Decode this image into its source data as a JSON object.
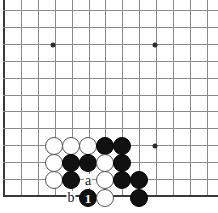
{
  "board": {
    "title": "Go board diagram",
    "geometry": {
      "width": 218,
      "height": 213,
      "origin_x": 4,
      "origin_y": 10,
      "spacing": 16.9,
      "cols": 13,
      "rows": 12,
      "stone_size": 18
    },
    "colors": {
      "background": "#ffffff",
      "grid": "#8a8a8a",
      "edge": "#3a3a3a",
      "black_stone": "#111111",
      "white_stone": "#ffffff",
      "star_point": "#2b2b2b",
      "label_text": "#141414"
    },
    "edges": {
      "left": true,
      "bottom": true,
      "top": false,
      "right": false
    },
    "star_points": [
      {
        "name": "star-point-upper-left",
        "x": 53,
        "y": 45
      },
      {
        "name": "star-point-upper-right",
        "x": 155,
        "y": 45
      },
      {
        "name": "star-point-lower-right",
        "x": 155,
        "y": 146
      }
    ],
    "stones": [
      {
        "name": "white-stone-1",
        "color": "white",
        "x": 54,
        "y": 146,
        "label": ""
      },
      {
        "name": "white-stone-2",
        "color": "white",
        "x": 71,
        "y": 146,
        "label": ""
      },
      {
        "name": "white-stone-3",
        "color": "white",
        "x": 88,
        "y": 146,
        "label": ""
      },
      {
        "name": "black-stone-1",
        "color": "black",
        "x": 105,
        "y": 146,
        "label": ""
      },
      {
        "name": "black-stone-2",
        "color": "black",
        "x": 122,
        "y": 146,
        "label": ""
      },
      {
        "name": "white-stone-4",
        "color": "white",
        "x": 54,
        "y": 163,
        "label": ""
      },
      {
        "name": "black-stone-3",
        "color": "black",
        "x": 71,
        "y": 163,
        "label": ""
      },
      {
        "name": "black-stone-4",
        "color": "black",
        "x": 88,
        "y": 163,
        "label": ""
      },
      {
        "name": "white-stone-5",
        "color": "white",
        "x": 105,
        "y": 163,
        "label": ""
      },
      {
        "name": "black-stone-5",
        "color": "black",
        "x": 122,
        "y": 163,
        "label": ""
      },
      {
        "name": "white-stone-6",
        "color": "white",
        "x": 54,
        "y": 180,
        "label": ""
      },
      {
        "name": "black-stone-6",
        "color": "black",
        "x": 71,
        "y": 180,
        "label": ""
      },
      {
        "name": "white-stone-7",
        "color": "white",
        "x": 105,
        "y": 180,
        "label": ""
      },
      {
        "name": "black-stone-7",
        "color": "black",
        "x": 122,
        "y": 180,
        "label": ""
      },
      {
        "name": "black-stone-8",
        "color": "black",
        "x": 139,
        "y": 180,
        "label": ""
      },
      {
        "name": "black-stone-move-1",
        "color": "black",
        "x": 88,
        "y": 198,
        "label": "1"
      },
      {
        "name": "white-stone-8",
        "color": "white",
        "x": 105,
        "y": 198,
        "label": ""
      },
      {
        "name": "black-stone-9",
        "color": "black",
        "x": 139,
        "y": 198,
        "label": ""
      }
    ],
    "point_labels": [
      {
        "name": "point-label-a",
        "text": "a",
        "x": 88,
        "y": 181
      },
      {
        "name": "point-label-b",
        "text": "b",
        "x": 71,
        "y": 198
      }
    ]
  }
}
